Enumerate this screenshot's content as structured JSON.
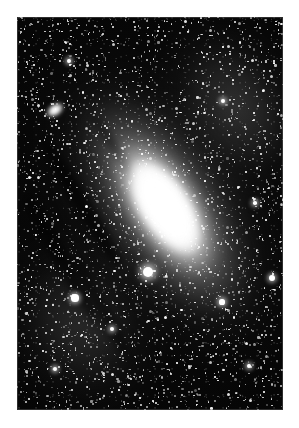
{
  "page": {
    "background_color": "#ffffff",
    "margin_left": 17,
    "margin_top": 17
  },
  "plate": {
    "label": "astronomical-photographic-plate",
    "subject": "Andromeda Galaxy",
    "background_color": "#000000",
    "width": 266,
    "height": 393,
    "left": 17,
    "top": 17
  },
  "galaxy": {
    "name": "spiral-galaxy-m31",
    "core_color": "#ffffff",
    "halo_color": "#bebebe",
    "position_angle_deg": -33,
    "core": {
      "cx": 148,
      "cy": 190,
      "rx": 26,
      "ry": 56
    },
    "inner_halo": {
      "cx": 148,
      "cy": 190,
      "rx": 40,
      "ry": 85
    },
    "mid_disc": {
      "cx": 148,
      "cy": 190,
      "rx": 66,
      "ry": 150
    },
    "outer_disc": {
      "cx": 148,
      "cy": 190,
      "rx": 115,
      "ry": 200
    }
  },
  "companion": {
    "name": "companion-elliptical-galaxy",
    "cx": 38,
    "cy": 93,
    "rx": 12,
    "ry": 8,
    "color": "#ffffff"
  },
  "dust_lanes": [
    {
      "name": "dust-lane-outer-sw",
      "left": 56,
      "top": 110,
      "width": 16,
      "height": 150,
      "rotation": -31,
      "opacity": 0.62
    },
    {
      "name": "dust-lane-far-sw",
      "left": 38,
      "top": 168,
      "width": 14,
      "height": 150,
      "rotation": -29,
      "opacity": 0.5
    },
    {
      "name": "dust-lane-south",
      "left": 78,
      "top": 230,
      "width": 13,
      "height": 120,
      "rotation": -28,
      "opacity": 0.45
    },
    {
      "name": "dust-lane-inner-ne",
      "left": 96,
      "top": 88,
      "width": 9,
      "height": 95,
      "rotation": -33,
      "opacity": 0.4
    }
  ],
  "bright_stars": [
    {
      "name": "bright-star-south-core",
      "x": 131,
      "y": 255,
      "r": 5.0,
      "class": "vbright"
    },
    {
      "name": "bright-star-sw-knot",
      "x": 58,
      "y": 281,
      "r": 3.6,
      "class": "bright"
    },
    {
      "name": "bright-star-east",
      "x": 255,
      "y": 261,
      "r": 3.2,
      "class": "bright"
    },
    {
      "name": "bright-star-south",
      "x": 205,
      "y": 285,
      "r": 2.6,
      "class": "bright"
    },
    {
      "name": "bright-star-sw-low",
      "x": 95,
      "y": 312,
      "r": 2.4,
      "class": "bright"
    },
    {
      "name": "bright-star-far-sw",
      "x": 38,
      "y": 352,
      "r": 2.2,
      "class": "bright"
    },
    {
      "name": "bright-star-ne-upper",
      "x": 206,
      "y": 84,
      "r": 2.0,
      "class": "bright"
    },
    {
      "name": "bright-star-nw",
      "x": 52,
      "y": 44,
      "r": 1.9,
      "class": "bright"
    },
    {
      "name": "bright-star-e-mid",
      "x": 238,
      "y": 186,
      "r": 1.8,
      "class": "bright"
    },
    {
      "name": "bright-star-se-low",
      "x": 232,
      "y": 349,
      "r": 1.9,
      "class": "bright"
    }
  ],
  "field": {
    "name": "background-star-field",
    "star_color": "#ffffff",
    "density": "dense",
    "description": "dense field of faint unresolved stars across the entire plate"
  }
}
